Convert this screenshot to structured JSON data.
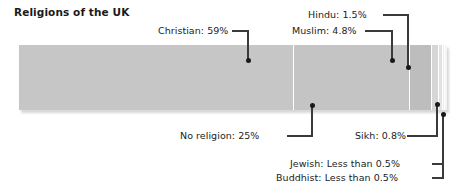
{
  "chart": {
    "title": "Religions of the UK",
    "type_label": "stacked-bar"
  },
  "chart_data": {
    "type": "bar",
    "subtype": "stacked-horizontal-single-bar",
    "title": "Religions of the UK",
    "xlabel": "",
    "ylabel": "",
    "categories": [
      "Christian",
      "No religion",
      "Muslim",
      "Hindu",
      "Sikh",
      "Jewish",
      "Buddhist"
    ],
    "values": [
      59,
      25,
      4.8,
      1.5,
      0.8,
      0.4,
      0.4
    ],
    "value_labels": [
      "Christian: 59%",
      "No religion: 25%",
      "Muslim: 4.8%",
      "Hindu: 1.5%",
      "Sikh: 0.8%",
      "Jewish: Less than 0.5%",
      "Buddhist: Less than 0.5%"
    ],
    "colors": [
      "#c6c6c6",
      "#c4c4c4",
      "#bdbdbd",
      "#d6d6d6",
      "#e2e2e2",
      "#ededed",
      "#f4f4f4"
    ],
    "xlim": [
      0,
      100
    ],
    "grid": false,
    "legend": "callout-labels"
  },
  "callouts": {
    "christian": {
      "text": "Christian: 59%"
    },
    "hindu": {
      "text": "Hindu: 1.5%"
    },
    "muslim": {
      "text": "Muslim: 4.8%"
    },
    "no_religion": {
      "text": "No religion: 25%"
    },
    "sikh": {
      "text": "Sikh: 0.8%"
    },
    "jewish": {
      "text": "Jewish: Less than 0.5%"
    },
    "buddhist": {
      "text": "Buddhist: Less than 0.5%"
    }
  }
}
